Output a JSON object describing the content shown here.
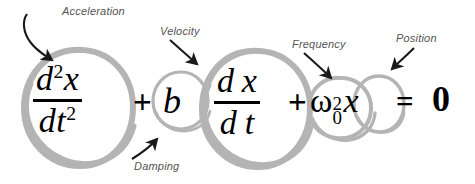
{
  "figure": {
    "background_color": "#ffffff",
    "circle_color": "#b4b4b4",
    "arrow_color": "#1a1a1a",
    "label_color": "#545454",
    "equation_color": "#000000"
  },
  "equation": {
    "plain_text": "d^2x/dt^2 + b dx/dt + omega_0^2 x = 0",
    "terms": [
      {
        "id": "acceleration",
        "numerator_base": "d",
        "numerator_exponent": "2",
        "numerator_variable": "x",
        "denominator_base": "d",
        "denominator_variable": "t",
        "denominator_exponent": "2"
      },
      {
        "id": "damping",
        "symbol": "b"
      },
      {
        "id": "velocity",
        "numerator_base": "d",
        "numerator_variable": "x",
        "denominator_base": "d",
        "denominator_variable": "t"
      },
      {
        "id": "frequency",
        "symbol": "ω",
        "subscript": "0",
        "superscript": "2",
        "variable": "x"
      }
    ],
    "operator_plus_1": "+",
    "operator_plus_2": "+",
    "equals": "=",
    "right_hand_side": "0"
  },
  "annotations": [
    {
      "id": "acceleration",
      "label": "Acceleration",
      "points_to": "d^2x/dt^2",
      "arrow": "curved-down-right"
    },
    {
      "id": "velocity",
      "label": "Velocity",
      "points_to": "dx/dt",
      "arrow": "curved-down-right"
    },
    {
      "id": "damping",
      "label": "Damping",
      "points_to": "b",
      "arrow": "curved-up-right"
    },
    {
      "id": "frequency",
      "label": "Frequency",
      "points_to": "ω_0^2",
      "arrow": "curved-down-right"
    },
    {
      "id": "position",
      "label": "Position",
      "points_to": "x",
      "arrow": "straight-down-left"
    }
  ]
}
